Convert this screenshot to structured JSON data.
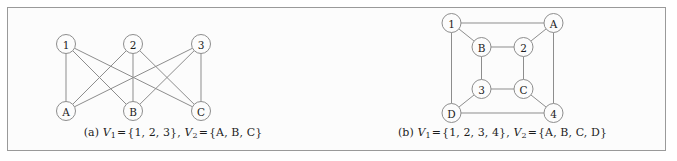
{
  "panel": {
    "background_color": "#fcfcfc",
    "border_color": "#9a9a9a"
  },
  "style": {
    "edge_color": "#8d8d8d",
    "node_fill": "#fcfcfc",
    "node_stroke": "#8d8d8d",
    "label_color": "#1d1d1d"
  },
  "figures": [
    {
      "key": "a",
      "tag": "(a)",
      "caption_text": "(a) V1 = {1, 2, 3}, V2 = {A, B, C}",
      "caption": {
        "tag": "(a)",
        "v1_name": "V",
        "v1_sub": "1",
        "v1_eq": "=",
        "v1_set": "{1, 2, 3},",
        "v2_name": "V",
        "v2_sub": "2",
        "v2_eq": "=",
        "v2_set": "{A, B, C}"
      },
      "graph": {
        "type": "complete-bipartite",
        "name": "K3,3",
        "partition_1": [
          "1",
          "2",
          "3"
        ],
        "partition_2": [
          "A",
          "B",
          "C"
        ],
        "nodes": [
          {
            "id": "1",
            "label": "1",
            "x": 58,
            "y": 36
          },
          {
            "id": "2",
            "label": "2",
            "x": 125,
            "y": 36
          },
          {
            "id": "3",
            "label": "3",
            "x": 193,
            "y": 36
          },
          {
            "id": "A",
            "label": "A",
            "x": 58,
            "y": 103
          },
          {
            "id": "B",
            "label": "B",
            "x": 125,
            "y": 103
          },
          {
            "id": "C",
            "label": "C",
            "x": 193,
            "y": 103
          }
        ],
        "edges": [
          [
            "1",
            "A"
          ],
          [
            "1",
            "B"
          ],
          [
            "1",
            "C"
          ],
          [
            "2",
            "A"
          ],
          [
            "2",
            "B"
          ],
          [
            "2",
            "C"
          ],
          [
            "3",
            "A"
          ],
          [
            "3",
            "B"
          ],
          [
            "3",
            "C"
          ]
        ],
        "node_radius": 9.5
      }
    },
    {
      "key": "b",
      "tag": "(b)",
      "caption_text": "(b) V1 = {1, 2, 3, 4}, V2 = {A, B, C, D}",
      "caption": {
        "tag": "(b)",
        "v1_name": "V",
        "v1_sub": "1",
        "v1_eq": "=",
        "v1_set": "{1, 2, 3, 4},",
        "v2_name": "V",
        "v2_sub": "2",
        "v2_eq": "=",
        "v2_set": "{A, B, C, D}"
      },
      "graph": {
        "type": "cube-bipartite",
        "name": "Q3",
        "partition_1": [
          "1",
          "2",
          "3",
          "4"
        ],
        "partition_2": [
          "A",
          "B",
          "C",
          "D"
        ],
        "nodes": [
          {
            "id": "1",
            "label": "1",
            "x": 45,
            "y": 15
          },
          {
            "id": "A",
            "label": "A",
            "x": 147,
            "y": 15
          },
          {
            "id": "B",
            "label": "B",
            "x": 75,
            "y": 39
          },
          {
            "id": "2",
            "label": "2",
            "x": 117,
            "y": 39
          },
          {
            "id": "3",
            "label": "3",
            "x": 75,
            "y": 81
          },
          {
            "id": "C",
            "label": "C",
            "x": 117,
            "y": 81
          },
          {
            "id": "D",
            "label": "D",
            "x": 45,
            "y": 105
          },
          {
            "id": "4",
            "label": "4",
            "x": 147,
            "y": 105
          }
        ],
        "edges": [
          [
            "1",
            "A"
          ],
          [
            "1",
            "D"
          ],
          [
            "A",
            "4"
          ],
          [
            "D",
            "4"
          ],
          [
            "B",
            "2"
          ],
          [
            "B",
            "3"
          ],
          [
            "2",
            "C"
          ],
          [
            "3",
            "C"
          ],
          [
            "1",
            "B"
          ],
          [
            "A",
            "2"
          ],
          [
            "D",
            "3"
          ],
          [
            "4",
            "C"
          ]
        ],
        "node_radius": 9.5
      }
    }
  ]
}
